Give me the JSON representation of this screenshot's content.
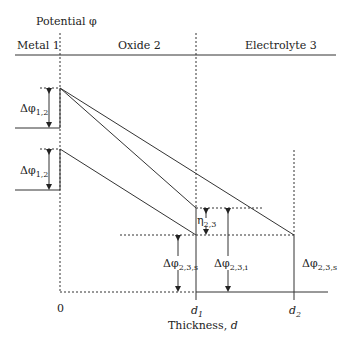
{
  "title": "Potential φ",
  "regions": [
    "Metal 1",
    "Oxide 2",
    "Electrolyte 3"
  ],
  "labels": {
    "dphi12_top": {
      "main": "Δφ",
      "sub": "1,2"
    },
    "dphi12_bottom": {
      "main": "Δφ",
      "sub": "1,2"
    },
    "eta23": {
      "main": "η",
      "sub": "2,3"
    },
    "dphi23s_left": {
      "main": "Δφ",
      "sub": "2,3,s"
    },
    "dphi23i": {
      "main": "Δφ",
      "sub": "2,3,i"
    },
    "dphi23s_right": {
      "main": "Δφ",
      "sub": "2,3,s"
    }
  },
  "axis": {
    "origin": "0",
    "d1": {
      "main": "d",
      "sub": "1"
    },
    "d2": {
      "main": "d",
      "sub": "2"
    },
    "xlabel_prefix": "Thickness, ",
    "xlabel_var": "d"
  }
}
